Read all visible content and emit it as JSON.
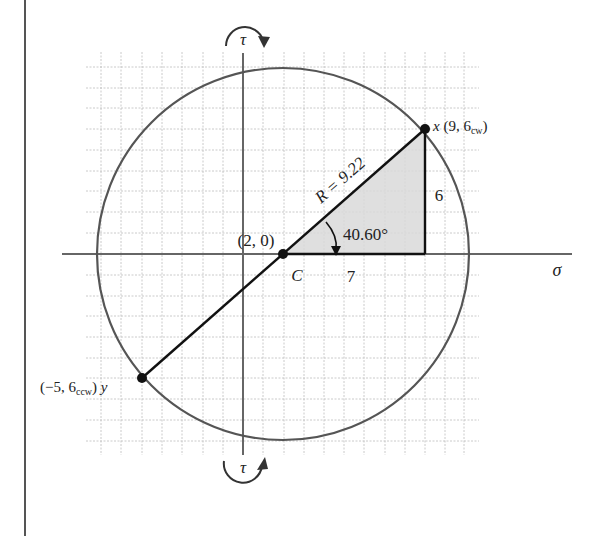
{
  "diagram": {
    "type": "mohrs-circle",
    "axes": {
      "horizontal_label": "σ",
      "vertical_label_top": "τ",
      "vertical_label_bottom": "τ"
    },
    "center": {
      "label": "C",
      "coord_label": "(2, 0)",
      "sigma": 2,
      "tau": 0
    },
    "radius": {
      "label": "R = 9.22",
      "value": 9.22
    },
    "point_x": {
      "name": "x",
      "coord_label": "(9, 6",
      "sub": "cw",
      "close": ")",
      "sigma": 9,
      "tau": 6,
      "sense": "cw"
    },
    "point_y": {
      "name": "y",
      "coord_label": "(−5, 6",
      "sub": "ccw",
      "close": ")",
      "sigma": -5,
      "tau": 6,
      "sense": "ccw"
    },
    "triangle": {
      "horizontal_leg": "7",
      "vertical_leg": "6",
      "angle_label": "40.60°",
      "angle_deg": 40.6
    },
    "colors": {
      "circle": "#555555",
      "axis": "#666666",
      "diameter": "#111111",
      "grid": "#bbbbbb",
      "shade": "#d9d9d9"
    }
  }
}
